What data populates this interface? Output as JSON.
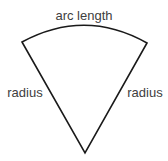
{
  "diagram": {
    "labels": {
      "arc": "arc length",
      "left_side": "radius",
      "right_side": "radius"
    },
    "colors": {
      "stroke": "#1a1a1a",
      "text": "#404040",
      "background": "#ffffff"
    },
    "geometry": {
      "apex": [
        85,
        153
      ],
      "left_corner": [
        22,
        42
      ],
      "right_corner": [
        147,
        43
      ],
      "arc_peak_y": 26
    }
  }
}
